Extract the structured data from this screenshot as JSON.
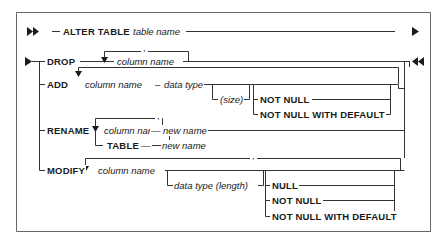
{
  "diagram": {
    "type": "syntax-railroad",
    "colors": {
      "line": "#333333",
      "text": "#1a1a1a",
      "background": "#ffffff",
      "frame": "#555555"
    },
    "header": {
      "keyword": "ALTER TABLE",
      "variable": "table name"
    },
    "branches": {
      "drop": {
        "keyword": "DROP",
        "repeat_separator": ",",
        "variable": "column name"
      },
      "add": {
        "keyword": "ADD",
        "column": "column name",
        "dash": "–",
        "data_type": "data type",
        "size": "(size)",
        "options": [
          "NOT NULL",
          "NOT NULL WITH DEFAULT"
        ]
      },
      "rename": {
        "keyword": "RENAME",
        "repeat_separator": ",",
        "column": "column name",
        "dash": "—",
        "new_name": "new name",
        "table_keyword": "TABLE",
        "table_dash": "—",
        "table_new_name": "new name"
      },
      "modify": {
        "keyword": "MODIFY",
        "repeat_separator": ",",
        "column": "column name",
        "data_type_length": "data type (length)",
        "options": [
          "NULL",
          "NOT NULL",
          "NOT NULL WITH DEFAULT"
        ]
      }
    }
  }
}
